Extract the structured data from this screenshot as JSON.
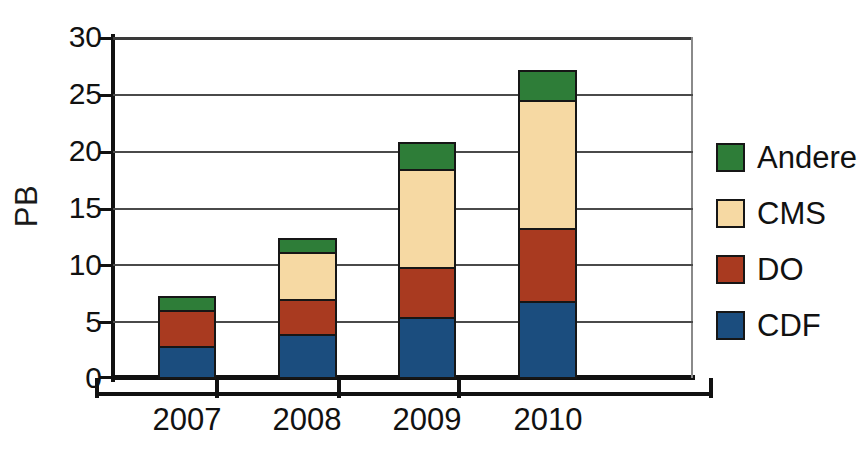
{
  "chart_data": {
    "type": "bar",
    "bar_mode": "stacked",
    "title": "",
    "xlabel": "",
    "ylabel": "PB",
    "categories": [
      "2007",
      "2008",
      "2009",
      "2010"
    ],
    "ylim": [
      0,
      30
    ],
    "yticks": [
      0,
      5,
      10,
      15,
      20,
      25,
      30
    ],
    "ytick_labels": [
      "0",
      "5",
      "10",
      "15",
      "20",
      "25",
      "30"
    ],
    "grid": true,
    "grid_axis": "y",
    "legend_position": "right",
    "series": [
      {
        "name": "CDF",
        "color": "#1b4d7e",
        "values": [
          2.7,
          3.8,
          5.3,
          6.7
        ]
      },
      {
        "name": "DO",
        "color": "#a93a20",
        "values": [
          3.2,
          3.1,
          4.4,
          6.4
        ]
      },
      {
        "name": "CMS",
        "color": "#f6d9a3",
        "values": [
          0.0,
          4.1,
          8.6,
          11.3
        ]
      },
      {
        "name": "Andere",
        "color": "#2e7d38",
        "values": [
          1.2,
          1.2,
          2.4,
          2.6
        ]
      }
    ],
    "stack_totals": [
      7.1,
      12.2,
      20.7,
      27.0
    ],
    "legend_order": [
      "Andere",
      "CMS",
      "DO",
      "CDF"
    ]
  },
  "axis": {
    "y_title": "PB",
    "y_labels": [
      "30",
      "25",
      "20",
      "15",
      "10",
      "5",
      "0"
    ],
    "x_labels": [
      "2007",
      "2008",
      "2009",
      "2010"
    ]
  },
  "legend": {
    "items": [
      {
        "label": "Andere",
        "color": "#2e7d38"
      },
      {
        "label": "CMS",
        "color": "#f6d9a3"
      },
      {
        "label": "DO",
        "color": "#a93a20"
      },
      {
        "label": "CDF",
        "color": "#1b4d7e"
      }
    ]
  },
  "colors": {
    "cdf": "#1b4d7e",
    "do": "#a93a20",
    "cms": "#f6d9a3",
    "andere": "#2e7d38",
    "axis": "#111111",
    "grid": "#4a4a4a",
    "background": "#ffffff"
  }
}
